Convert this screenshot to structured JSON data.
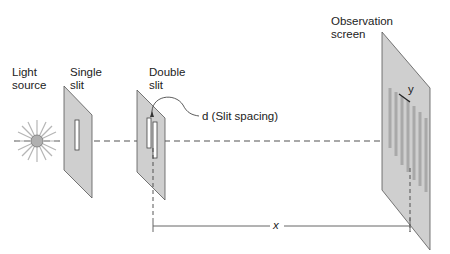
{
  "labels": {
    "light_source_1": "Light",
    "light_source_2": "source",
    "single_slit_1": "Single",
    "single_slit_2": "slit",
    "double_slit_1": "Double",
    "double_slit_2": "slit",
    "slit_spacing": "d (Slit spacing)",
    "observation_1": "Observation",
    "observation_2": "screen",
    "distance_x": "x",
    "fringe_y": "y"
  },
  "colors": {
    "panel_fill": "#cfcfcf",
    "panel_stroke": "#555555",
    "beam": "#a8a8a8",
    "fringe": "#a9a9a9",
    "text": "#222222"
  }
}
